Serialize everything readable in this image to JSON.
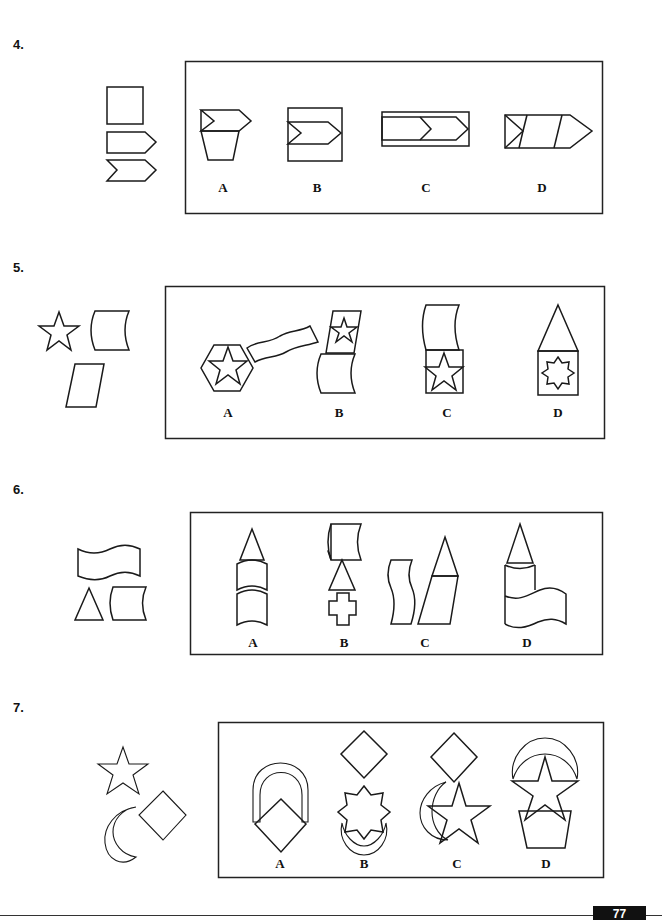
{
  "page": {
    "page_number": "77"
  },
  "questions": [
    {
      "number": "4.",
      "given_shapes": [
        "square",
        "pentagon-arrow",
        "chevron-arrow"
      ],
      "options": [
        {
          "label": "A",
          "description": "chevron-arrow on top of trapezoid"
        },
        {
          "label": "B",
          "description": "chevron-arrow inside square"
        },
        {
          "label": "C",
          "description": "long chevron-arrow inside rectangle"
        },
        {
          "label": "D",
          "description": "segmented arrow with diagonal divisions"
        }
      ]
    },
    {
      "number": "5.",
      "given_shapes": [
        "star",
        "concave rectangle",
        "parallelogram"
      ],
      "options": [
        {
          "label": "A",
          "description": "star in hexagon with wavy band"
        },
        {
          "label": "B",
          "description": "star in parallelogram above concave shape"
        },
        {
          "label": "C",
          "description": "concave shape above square with star"
        },
        {
          "label": "D",
          "description": "triangle above square with 8-point star"
        }
      ]
    },
    {
      "number": "6.",
      "given_shapes": [
        "wavy flag",
        "triangle",
        "concave rectangle"
      ],
      "options": [
        {
          "label": "A",
          "description": "triangle on two stacked curved segments"
        },
        {
          "label": "B",
          "description": "concave shape, triangle, cross"
        },
        {
          "label": "C",
          "description": "wavy strip beside triangle on parallelogram"
        },
        {
          "label": "D",
          "description": "triangle on curved cylinder with wavy flag"
        }
      ]
    },
    {
      "number": "7.",
      "given_shapes": [
        "star",
        "crescent moon",
        "diamond"
      ],
      "options": [
        {
          "label": "A",
          "description": "diamond over arch"
        },
        {
          "label": "B",
          "description": "diamond over 8-point star over crescent"
        },
        {
          "label": "C",
          "description": "diamond over star with crescent"
        },
        {
          "label": "D",
          "description": "crescent over star over trapezoid"
        }
      ]
    }
  ]
}
